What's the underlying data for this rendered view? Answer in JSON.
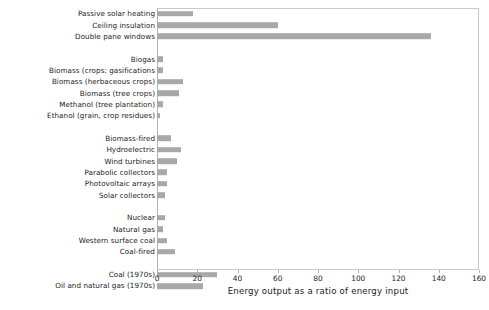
{
  "chart_data": {
    "type": "bar",
    "orientation": "horizontal",
    "title": "",
    "xlabel": "Energy output as a ratio of energy input",
    "ylabel": "",
    "xlim": [
      0,
      160
    ],
    "xticks": [
      0,
      20,
      40,
      60,
      80,
      100,
      120,
      140,
      160
    ],
    "grid": false,
    "legend": null,
    "bar_color": "#a8a8a8",
    "categories": [
      "Passive solar heating",
      "Ceiling insulation",
      "Double pane windows",
      "",
      "Biogas",
      "Biomass (crops: gasifications",
      "Biomass (herbaceous crops)",
      "Biomass (tree crops)",
      "Methanol (tree plantation)",
      "Ethanol (grain, crop residues)",
      "",
      "Biomass-fired",
      "Hydroelectric",
      "Wind turbines",
      "Parabolic collectors",
      "Photovoltaic arrays",
      "Solar collectors",
      "",
      "Nuclear",
      "Natural gas",
      "Western surface coal",
      "Coal-fired",
      "",
      "Coal (1970s)",
      "Oil and natural gas (1970s)"
    ],
    "values": [
      18,
      60,
      136,
      null,
      3,
      3,
      13,
      11,
      3,
      1.5,
      null,
      7,
      12,
      10,
      5,
      5,
      4,
      null,
      4,
      3,
      5,
      9,
      null,
      30,
      23
    ]
  },
  "axis": {
    "tick_labels": [
      "0",
      "20",
      "40",
      "60",
      "80",
      "100",
      "120",
      "140",
      "160"
    ]
  }
}
